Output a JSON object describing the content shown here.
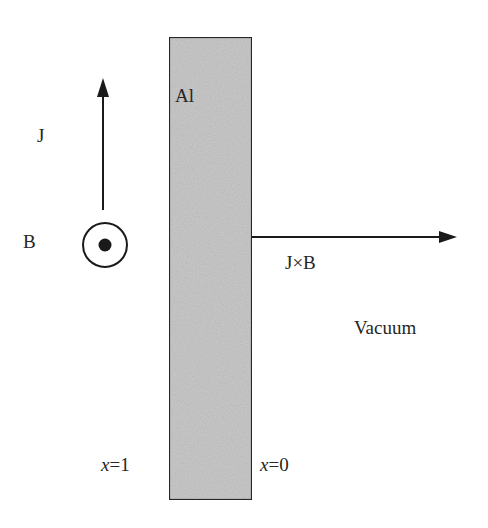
{
  "diagram": {
    "colors": {
      "background": "#ffffff",
      "slab_fill": "#c8c8c8",
      "slab_border": "#2a2a2a",
      "arrow": "#1a1a1a",
      "text": "#262626"
    },
    "slab": {
      "material_label": "Al"
    },
    "labels": {
      "current": "J",
      "field": "B",
      "force": "J×B",
      "region": "Vacuum",
      "left_boundary_var": "x",
      "left_boundary_value": "=1",
      "right_boundary_var": "x",
      "right_boundary_value": "=0"
    },
    "symbols": {
      "current_arrow": "arrow-up",
      "field_symbol": "out-of-page-dot",
      "force_arrow": "arrow-right"
    }
  }
}
